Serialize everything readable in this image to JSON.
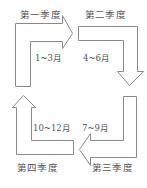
{
  "diagram": {
    "title": "",
    "quarters": [
      {
        "label": "第一季度",
        "months": "1~3月",
        "arrow_direction": "right"
      },
      {
        "label": "第二季度",
        "months": "4~6月",
        "arrow_direction": "down"
      },
      {
        "label": "第三季度",
        "months": "7~9月",
        "arrow_direction": "left"
      },
      {
        "label": "第四季度",
        "months": "10~12月",
        "arrow_direction": "up"
      }
    ],
    "colors": {
      "stroke": "#8a8a8a",
      "fill": "#ffffff",
      "text": "#555555"
    }
  }
}
